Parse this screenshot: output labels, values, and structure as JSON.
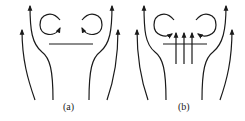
{
  "figure": {
    "panels": [
      {
        "label": "(a)",
        "description": "Flow around a flat plate: streamlines pass around edges, two recirculating vortices above plate"
      },
      {
        "label": "(b)",
        "description": "Flow around a plate with vertical jets/through-flow: three upward arrows through plate, two vortices above"
      }
    ],
    "colors": {
      "stroke": "#1a1a1a",
      "background": "#ffffff"
    }
  }
}
